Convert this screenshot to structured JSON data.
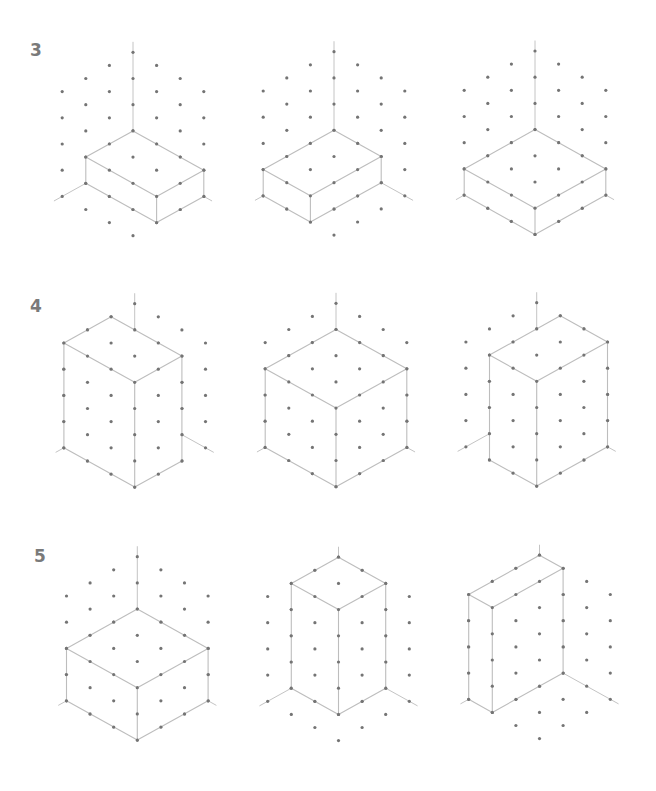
{
  "style": {
    "background": "#ffffff",
    "dot_color": "#747474",
    "line_color": "#bdbdbd",
    "label_color": "#7a7a7a",
    "dot_radius": 1.6
  },
  "projection": {
    "x_unit": [
      23.6,
      13.1
    ],
    "y_unit": [
      -23.6,
      13.1
    ],
    "z_unit": [
      0,
      -26.2
    ]
  },
  "grid": {
    "floor_x_max": 3,
    "floor_y_max": 3,
    "wall_z_max": 4,
    "axis_extent_floor": 3.35,
    "axis_extent_vertical": 4.4
  },
  "rows": [
    {
      "label": "3",
      "label_pos": [
        30,
        42
      ],
      "figures": [
        {
          "id": "fig-3a",
          "origin": [
            133,
            157.1
          ],
          "box": {
            "x": [
              0,
              3
            ],
            "y": [
              0,
              2
            ],
            "z": [
              0,
              1
            ]
          }
        },
        {
          "id": "fig-3b",
          "origin": [
            334,
            156.5
          ],
          "box": {
            "x": [
              0,
              2
            ],
            "y": [
              0,
              3
            ],
            "z": [
              0,
              1
            ]
          }
        },
        {
          "id": "fig-3c",
          "origin": [
            535,
            155.8
          ],
          "box": {
            "x": [
              0,
              3
            ],
            "y": [
              0,
              3
            ],
            "z": [
              0,
              1
            ]
          }
        }
      ]
    },
    {
      "label": "4",
      "label_pos": [
        30,
        298
      ],
      "figures": [
        {
          "id": "fig-4a",
          "origin": [
            134.7,
            408.5
          ],
          "box": {
            "x": [
              0,
              3
            ],
            "y": [
              1,
              3
            ],
            "z": [
              0,
              4
            ]
          }
        },
        {
          "id": "fig-4b",
          "origin": [
            336,
            408.1
          ],
          "box": {
            "x": [
              0,
              3
            ],
            "y": [
              0,
              3
            ],
            "z": [
              0,
              3
            ]
          }
        },
        {
          "id": "fig-4c",
          "origin": [
            536.7,
            407.5
          ],
          "box": {
            "x": [
              1,
              3
            ],
            "y": [
              0,
              3
            ],
            "z": [
              0,
              4
            ]
          }
        }
      ]
    },
    {
      "label": "5",
      "label_pos": [
        34,
        548
      ],
      "figures": [
        {
          "id": "fig-5a",
          "origin": [
            137.3,
            661.5
          ],
          "box": {
            "x": [
              0,
              3
            ],
            "y": [
              0,
              3
            ],
            "z": [
              0,
              2
            ]
          }
        },
        {
          "id": "fig-5b",
          "origin": [
            338.5,
            662
          ],
          "box": {
            "x": [
              0,
              2
            ],
            "y": [
              0,
              2
            ],
            "z": [
              0,
              4
            ]
          }
        },
        {
          "id": "fig-5c",
          "origin": [
            539.5,
            660
          ],
          "box": {
            "x": [
              0,
              1
            ],
            "y": [
              0,
              3
            ],
            "z": [
              0,
              4
            ]
          }
        }
      ]
    }
  ]
}
